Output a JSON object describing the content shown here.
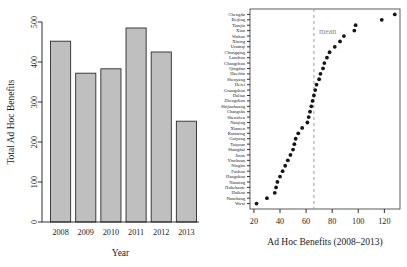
{
  "figure": {
    "panels": [
      "bar-chart",
      "dot-plot"
    ]
  },
  "chart_data": [
    {
      "id": "bar",
      "type": "bar",
      "title": "",
      "xlabel": "Year",
      "ylabel": "Total Ad Hoc Benefits",
      "categories": [
        "2008",
        "2009",
        "2010",
        "2011",
        "2012",
        "2013"
      ],
      "values": [
        452,
        372,
        383,
        485,
        425,
        252
      ],
      "ylim": [
        0,
        500
      ],
      "yticks": [
        0,
        100,
        200,
        300,
        400,
        500
      ],
      "ytick_labels": [
        "0",
        "100",
        "200",
        "300",
        "400",
        "500"
      ],
      "grid": false,
      "legend": "none",
      "bar_fill": "#bfbfbf",
      "bar_edge": "#2b2b2b"
    },
    {
      "id": "dot",
      "type": "scatter",
      "title": "",
      "xlabel": "Ad Hoc Benefits (2008–2013)",
      "ylabel": "",
      "xlim": [
        17,
        132
      ],
      "xticks": [
        20,
        40,
        60,
        80,
        100,
        120
      ],
      "xtick_labels": [
        "20",
        "40",
        "60",
        "80",
        "100",
        "120"
      ],
      "grid": false,
      "legend": "none",
      "annotations": [
        {
          "name": "mean-line-label",
          "text": "mean",
          "x": 66
        }
      ],
      "mean_value": 66,
      "categories": [
        "Chengdu",
        "Beijing",
        "Tianjin",
        "Xian",
        "Wuhan",
        "Xining",
        "Urumqi",
        "Chongqing",
        "Lanzhou",
        "Changchun",
        "Qingdao",
        "Haerbin",
        "Shenyang",
        "Hefei",
        "Guangzhou",
        "Dalian",
        "Zhengzhou",
        "Shijiazhuang",
        "Changsha",
        "Shenzhen",
        "Nanjing",
        "Xiamen",
        "Kunming",
        "Guiyang",
        "Taiyuan",
        "Shanghai",
        "Jinan",
        "Yinchuan",
        "Ningbo",
        "Fuzhou",
        "Hangzhou",
        "Nanning",
        "Huhehaote",
        "Haikou",
        "Nanchang",
        "Wuxi"
      ],
      "values": [
        128,
        118,
        98,
        97,
        89,
        86,
        82,
        78,
        76,
        74,
        73,
        71,
        70,
        68,
        67,
        66,
        65,
        64,
        63,
        62,
        61,
        57,
        54,
        52,
        51,
        50,
        48,
        46,
        44,
        42,
        40,
        38,
        37,
        36,
        30,
        22
      ],
      "dot_color": "#151515"
    }
  ]
}
